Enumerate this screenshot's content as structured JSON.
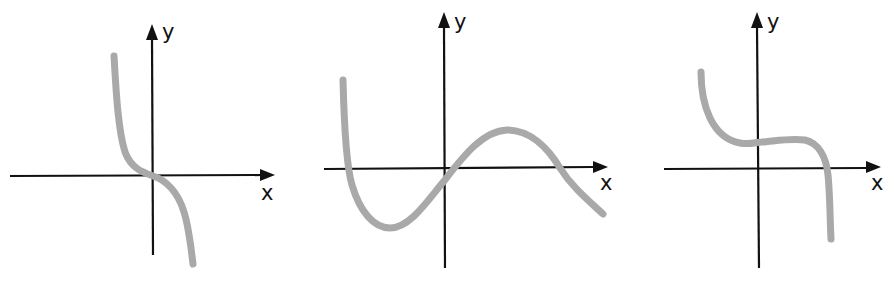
{
  "figure": {
    "curve_color": "#a9a9a9",
    "axis_color": "#111111",
    "graphs": [
      {
        "id": "graph-1",
        "x_label": "x",
        "y_label": "y",
        "shape": "decreasing cubic through origin, steep"
      },
      {
        "id": "graph-2",
        "x_label": "x",
        "y_label": "y",
        "shape": "negative-leading cubic with local min (left) and local max (right), three real roots"
      },
      {
        "id": "graph-3",
        "x_label": "x",
        "y_label": "y",
        "shape": "decreasing cubic with flat inflection above x-axis, one real root at positive x"
      }
    ]
  }
}
